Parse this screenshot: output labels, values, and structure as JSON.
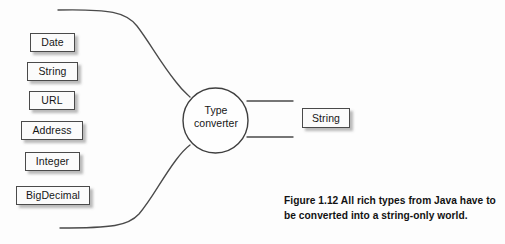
{
  "figure": {
    "background_color": "#fdfdfd",
    "stroke_color": "#4a4a4a",
    "text_color": "#161616"
  },
  "input_types": [
    {
      "label": "Date",
      "x": 30,
      "y": 33,
      "w": 45,
      "h": 19
    },
    {
      "label": "String",
      "x": 27,
      "y": 62,
      "w": 51,
      "h": 19
    },
    {
      "label": "URL",
      "x": 29,
      "y": 91,
      "w": 46,
      "h": 19
    },
    {
      "label": "Address",
      "x": 21,
      "y": 121,
      "w": 62,
      "h": 19
    },
    {
      "label": "Integer",
      "x": 25,
      "y": 152,
      "w": 55,
      "h": 19
    },
    {
      "label": "BigDecimal",
      "x": 16,
      "y": 186,
      "w": 74,
      "h": 19
    }
  ],
  "converter": {
    "label_line1": "Type",
    "label_line2": "converter",
    "cx": 215.5,
    "cy": 120.5,
    "r": 32.5
  },
  "output_types": [
    {
      "label": "String",
      "x": 302,
      "y": 108,
      "w": 48,
      "h": 20
    }
  ],
  "caption": {
    "line1": "Figure 1.12    All rich types from Java have to",
    "line2": "be converted into a string-only world."
  }
}
